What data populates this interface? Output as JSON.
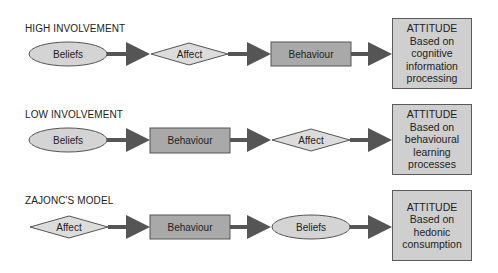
{
  "rows": [
    {
      "title": "HIGH INVOLVEMENT",
      "nodes": [
        {
          "shape": "ellipse",
          "label": "Beliefs"
        },
        {
          "shape": "diamond",
          "label": "Affect"
        },
        {
          "shape": "rect",
          "label": "Behaviour"
        }
      ],
      "attitude": {
        "heading": "ATTITUDE",
        "lines": [
          "Based on",
          "cognitive",
          "information",
          "processing"
        ]
      }
    },
    {
      "title": "LOW INVOLVEMENT",
      "nodes": [
        {
          "shape": "ellipse",
          "label": "Beliefs"
        },
        {
          "shape": "rect",
          "label": "Behaviour"
        },
        {
          "shape": "diamond",
          "label": "Affect"
        }
      ],
      "attitude": {
        "heading": "ATTITUDE",
        "lines": [
          "Based on",
          "behavioural",
          "learning",
          "processes"
        ]
      }
    },
    {
      "title": "ZAJONC'S MODEL",
      "nodes": [
        {
          "shape": "diamond",
          "label": "Affect"
        },
        {
          "shape": "rect",
          "label": "Behaviour"
        },
        {
          "shape": "ellipse",
          "label": "Beliefs"
        }
      ],
      "attitude": {
        "heading": "ATTITUDE",
        "lines": [
          "Based on",
          "hedonic",
          "consumption"
        ]
      }
    }
  ],
  "colors": {
    "ellipse_fill": "#d4d4d4",
    "diamond_fill": "#dcdcdc",
    "rect_fill": "#a9a9a9",
    "attitude_fill": "#cfcfcf",
    "arrow": "#555555",
    "stroke": "#555555"
  }
}
